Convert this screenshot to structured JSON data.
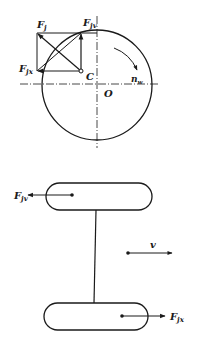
{
  "top_diagram": {
    "labels": {
      "fj": {
        "main": "F",
        "sub": "j"
      },
      "fjv": {
        "main": "F",
        "sub": "jv"
      },
      "fjx": {
        "main": "F",
        "sub": "jx"
      },
      "c": "C",
      "o": "O",
      "nw": {
        "main": "n",
        "sub": "w"
      }
    }
  },
  "bottom_diagram": {
    "labels": {
      "fjv": {
        "main": "F",
        "sub": "jv"
      },
      "fjx": {
        "main": "F",
        "sub": "jx"
      },
      "v": "v"
    }
  },
  "colors": {
    "stroke": "#1a1a1a",
    "background": "#ffffff"
  }
}
